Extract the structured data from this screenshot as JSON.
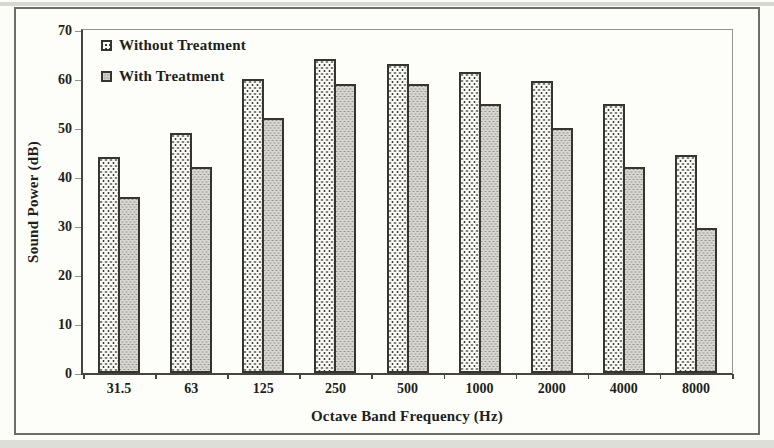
{
  "chart_data": {
    "type": "bar",
    "title": "",
    "categories": [
      "31.5",
      "63",
      "125",
      "250",
      "500",
      "1000",
      "2000",
      "4000",
      "8000"
    ],
    "series": [
      {
        "name": "Without Treatment",
        "values": [
          44,
          49,
          60,
          64,
          63,
          61.5,
          59.5,
          55,
          44.5
        ]
      },
      {
        "name": "With Treatment",
        "values": [
          36,
          42,
          52,
          59,
          59,
          55,
          50,
          42,
          29.5
        ]
      }
    ],
    "xlabel": "Octave Band Frequency (Hz)",
    "ylabel": "Sound Power (dB)",
    "ylim": [
      0,
      70
    ],
    "yticks": [
      0,
      10,
      20,
      30,
      40,
      50,
      60,
      70
    ],
    "grid": false,
    "legend_position": "top-left-inside",
    "bar_style": "stippled-pattern"
  },
  "colors": {
    "background": "#fdfdfa",
    "figure_border": "#6e6e66",
    "axis": "#45453e",
    "minor_frame": "#94938b",
    "text": "#211f1a",
    "bar_border": "#35342e",
    "bar_without_fill": "#f9f9f6",
    "bar_without_dot": "#3f3e38",
    "bar_with_fill": "#d8d7d2",
    "bar_with_dot": "#94938a"
  }
}
